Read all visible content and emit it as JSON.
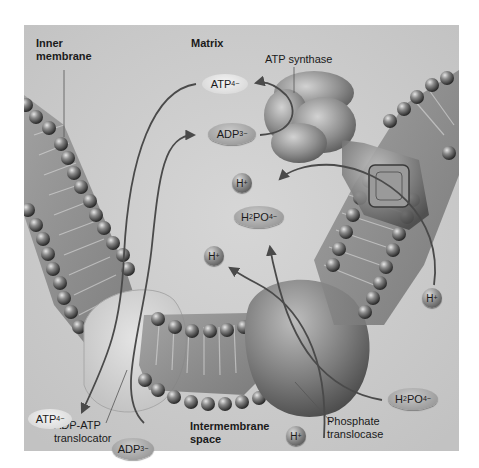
{
  "figure": {
    "regions": {
      "matrix": "Matrix",
      "intermembrane_space_line1": "Intermembrane",
      "intermembrane_space_line2": "space",
      "inner_membrane_line1": "Inner",
      "inner_membrane_line2": "membrane"
    },
    "proteins": {
      "atp_synthase": "ATP synthase",
      "adp_atp_translocator_line1": "ADP-ATP",
      "adp_atp_translocator_line2": "translocator",
      "phosphate_translocase_line1": "Phosphate",
      "phosphate_translocase_line2": "translocase"
    },
    "molecules": {
      "atp_matrix": {
        "base": "ATP",
        "charge": "4−"
      },
      "adp_matrix": {
        "base": "ADP",
        "charge": "3−"
      },
      "atp_ims": {
        "base": "ATP",
        "charge": "4−"
      },
      "adp_ims": {
        "base": "ADP",
        "charge": "3−"
      },
      "phosphate_matrix": {
        "h": "H",
        "h_sub": "2",
        "po": "PO",
        "po_sub": "4",
        "charge": "−"
      },
      "phosphate_ims": {
        "h": "H",
        "h_sub": "2",
        "po": "PO",
        "po_sub": "4",
        "charge": "−"
      },
      "proton": {
        "base": "H",
        "charge": "+"
      }
    },
    "colors": {
      "background": "#c9c9c9",
      "membrane_head": "#5a5a5a",
      "arrow": "#4a4a4a",
      "protein": "#a8a8a8"
    }
  }
}
